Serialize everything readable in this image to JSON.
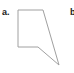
{
  "panels": [
    {
      "label": "a.",
      "shape": "pentagon-outline",
      "stroke": "#a0a0a0",
      "points": [
        [
          18,
          10
        ],
        [
          43,
          10
        ],
        [
          59,
          65
        ],
        [
          38,
          47
        ],
        [
          18,
          47
        ]
      ]
    },
    {
      "label": "b",
      "partial": true
    }
  ]
}
